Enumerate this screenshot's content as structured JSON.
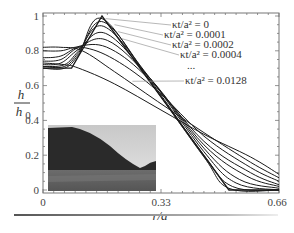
{
  "chart_data": {
    "type": "line",
    "title": "",
    "xlabel": "r/a",
    "ylabel": "h/h0",
    "xlim": [
      0,
      0.66
    ],
    "ylim": [
      0,
      1.0
    ],
    "x_ticks": [
      0,
      0.33,
      0.66
    ],
    "x_tick_labels": [
      "0",
      "0.33",
      "0.66"
    ],
    "y_ticks": [
      0,
      0.2,
      0.4,
      0.6,
      0.8,
      1
    ],
    "y_tick_labels": [
      "0",
      "0.2",
      "0.4",
      "0.6",
      "0.8",
      "1"
    ],
    "grid": false,
    "legend_position": "upper right (annotations with leader lines)",
    "annotations": [
      {
        "text": "κt/a² = 0",
        "label_pos": [
          0.47,
          0.965
        ],
        "points_to": [
          0.175,
          0.985
        ]
      },
      {
        "text": "κt/a² = 0.0001",
        "label_pos": [
          0.45,
          0.925
        ],
        "points_to": [
          0.2,
          0.95
        ]
      },
      {
        "text": "κt/a² = 0.0002",
        "label_pos": [
          0.47,
          0.885
        ],
        "points_to": [
          0.21,
          0.91
        ]
      },
      {
        "text": "κt/a² = 0.0004",
        "label_pos": [
          0.49,
          0.845
        ],
        "points_to": [
          0.22,
          0.87
        ]
      },
      {
        "text": "...",
        "label_pos": [
          0.51,
          0.8
        ],
        "points_to": null
      },
      {
        "text": "κt/a² = 0.0128",
        "label_pos": [
          0.53,
          0.635
        ],
        "points_to": [
          0.25,
          0.625
        ]
      }
    ],
    "series": [
      {
        "name": "κt/a² = 0",
        "x": [
          0,
          0.08,
          0.165,
          0.52,
          0.66
        ],
        "values": [
          0.7,
          0.7,
          1.0,
          0.0,
          0.0
        ]
      },
      {
        "name": "κt/a² = 0.0001",
        "x": [
          0,
          0.06,
          0.1,
          0.165,
          0.3,
          0.45,
          0.52,
          0.66
        ],
        "values": [
          0.7,
          0.7,
          0.78,
          0.985,
          0.62,
          0.19,
          0.01,
          0.0
        ]
      },
      {
        "name": "κt/a² = 0.0002",
        "x": [
          0,
          0.06,
          0.1,
          0.17,
          0.3,
          0.45,
          0.53,
          0.66
        ],
        "values": [
          0.71,
          0.71,
          0.79,
          0.965,
          0.63,
          0.2,
          0.02,
          0.0
        ]
      },
      {
        "name": "κt/a² = 0.0004",
        "x": [
          0,
          0.06,
          0.1,
          0.17,
          0.3,
          0.45,
          0.54,
          0.66
        ],
        "values": [
          0.71,
          0.72,
          0.8,
          0.94,
          0.64,
          0.22,
          0.04,
          0.0
        ]
      },
      {
        "name": "κt/a² = 0.0008",
        "x": [
          0,
          0.05,
          0.1,
          0.175,
          0.3,
          0.45,
          0.55,
          0.66
        ],
        "values": [
          0.72,
          0.73,
          0.81,
          0.9,
          0.64,
          0.24,
          0.06,
          0.01
        ]
      },
      {
        "name": "κt/a² = 0.0016",
        "x": [
          0,
          0.05,
          0.1,
          0.18,
          0.3,
          0.45,
          0.57,
          0.66
        ],
        "values": [
          0.74,
          0.75,
          0.82,
          0.86,
          0.64,
          0.26,
          0.08,
          0.02
        ]
      },
      {
        "name": "κt/a² = 0.0032",
        "x": [
          0,
          0.05,
          0.11,
          0.19,
          0.3,
          0.45,
          0.58,
          0.66
        ],
        "values": [
          0.76,
          0.77,
          0.83,
          0.81,
          0.63,
          0.28,
          0.1,
          0.03
        ]
      },
      {
        "name": "κt/a² = 0.0064",
        "x": [
          0,
          0.05,
          0.11,
          0.2,
          0.32,
          0.45,
          0.58,
          0.66
        ],
        "values": [
          0.8,
          0.8,
          0.82,
          0.75,
          0.57,
          0.31,
          0.13,
          0.05
        ]
      },
      {
        "name": "κt/a² = 0.0128",
        "x": [
          0,
          0.05,
          0.11,
          0.2,
          0.32,
          0.45,
          0.58,
          0.66
        ],
        "values": [
          0.82,
          0.82,
          0.8,
          0.68,
          0.51,
          0.33,
          0.16,
          0.07
        ]
      },
      {
        "name": "κt/a² (largest)",
        "x": [
          0,
          0.06,
          0.1,
          0.2,
          0.33,
          0.45,
          0.58,
          0.66
        ],
        "values": [
          0.73,
          0.72,
          0.7,
          0.61,
          0.46,
          0.32,
          0.19,
          0.09
        ]
      }
    ],
    "inset": {
      "type": "photo",
      "description": "grayscale photograph of a dark conical hill against a cloudy sky with grassland foreground",
      "x_range": [
        0.005,
        0.37
      ],
      "y_range": [
        0.0,
        0.37
      ]
    }
  },
  "axes": {
    "ylabel_numerator": "h",
    "ylabel_denominator": "h",
    "ylabel_subscript": "0",
    "xlabel": "r/a"
  }
}
